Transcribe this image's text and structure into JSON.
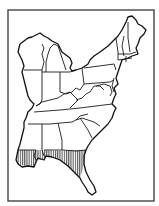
{
  "map": {
    "region": "Eastern United States",
    "style": "black-and-white outline map with state borders",
    "frame": {
      "x": 8,
      "y": 10,
      "width": 146,
      "height": 191,
      "stroke": "#444444"
    },
    "line_color": "#1a1a1a",
    "background": "#ffffff",
    "highlight": {
      "name": "range-area",
      "pattern": "vertical hatching",
      "color": "#1a1a1a",
      "location": "Gulf Coast: southern Louisiana, southern Mississippi, southern Alabama, Florida panhandle and western Florida peninsula"
    },
    "states_shown": [
      "Wisconsin",
      "Michigan",
      "Illinois",
      "Indiana",
      "Ohio",
      "Kentucky",
      "Tennessee",
      "Mississippi",
      "Alabama",
      "Georgia",
      "Florida",
      "South Carolina",
      "North Carolina",
      "Virginia",
      "West Virginia",
      "Maryland",
      "Delaware",
      "Pennsylvania",
      "New Jersey",
      "New York",
      "Connecticut",
      "Rhode Island",
      "Massachusetts",
      "Vermont",
      "New Hampshire",
      "Maine",
      "Louisiana"
    ],
    "labels": []
  }
}
